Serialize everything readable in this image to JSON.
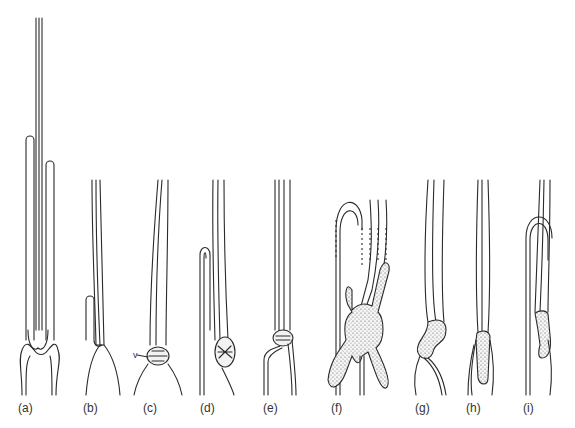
{
  "figure": {
    "panels": [
      {
        "id": "a",
        "label": "(a)",
        "x": 18
      },
      {
        "id": "b",
        "label": "(b)",
        "x": 83
      },
      {
        "id": "c",
        "label": "(c)",
        "x": 143
      },
      {
        "id": "d",
        "label": "(d)",
        "x": 200
      },
      {
        "id": "e",
        "label": "(e)",
        "x": 263
      },
      {
        "id": "f",
        "label": "(f)",
        "x": 331
      },
      {
        "id": "g",
        "label": "(g)",
        "x": 415
      },
      {
        "id": "h",
        "label": "(h)",
        "x": 466
      },
      {
        "id": "i",
        "label": "(i)",
        "x": 523
      }
    ],
    "annotation_v": "v",
    "stroke_color": "#2a2a2a"
  }
}
